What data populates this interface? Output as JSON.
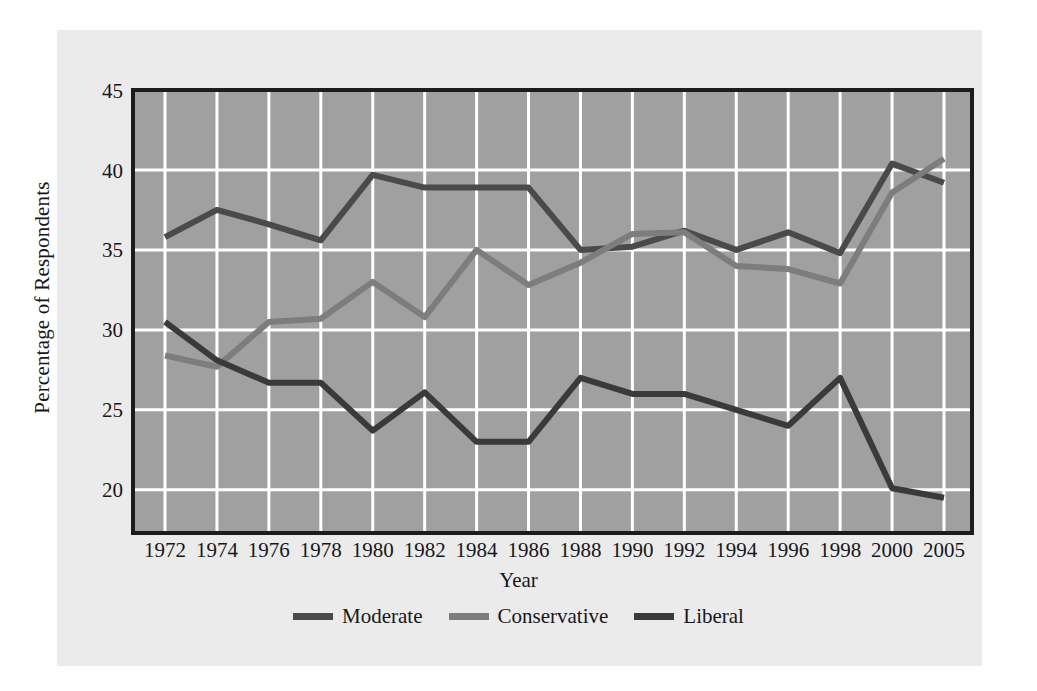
{
  "figure": {
    "background_color": "#ebebeb",
    "plot_background_color": "#a0a0a0",
    "gridline_color": "#ffffff",
    "axis_frame_color": "#1c1c1c"
  },
  "axes": {
    "y_label": "Percentage of Respondents",
    "x_label": "Year",
    "y_ticks": [
      "20",
      "25",
      "30",
      "35",
      "40",
      "45"
    ],
    "x_ticks": [
      "1972",
      "1974",
      "1976",
      "1978",
      "1980",
      "1982",
      "1984",
      "1986",
      "1988",
      "1990",
      "1992",
      "1994",
      "1996",
      "1998",
      "2000",
      "2005"
    ]
  },
  "legend": {
    "items": [
      {
        "label": "Moderate",
        "color": "#4a4a4a"
      },
      {
        "label": "Conservative",
        "color": "#7d7d7d"
      },
      {
        "label": "Liberal",
        "color": "#3a3a3a"
      }
    ]
  },
  "chart_data": {
    "type": "line",
    "title": "",
    "xlabel": "Year",
    "ylabel": "Percentage of Respondents",
    "categories": [
      "1972",
      "1974",
      "1976",
      "1978",
      "1980",
      "1982",
      "1984",
      "1986",
      "1988",
      "1990",
      "1992",
      "1994",
      "1996",
      "1998",
      "2000",
      "2005"
    ],
    "ylim": [
      17.3,
      45
    ],
    "yticks": [
      20,
      25,
      30,
      35,
      40,
      45
    ],
    "grid": true,
    "legend_position": "bottom",
    "series": [
      {
        "name": "Moderate",
        "color": "#4a4a4a",
        "values": [
          35.8,
          37.5,
          36.6,
          35.6,
          39.7,
          38.9,
          38.9,
          38.9,
          35.0,
          35.2,
          36.2,
          35.0,
          36.1,
          34.8,
          40.4,
          39.2
        ]
      },
      {
        "name": "Conservative",
        "color": "#7d7d7d",
        "values": [
          28.4,
          27.7,
          30.5,
          30.7,
          33.0,
          30.8,
          35.0,
          32.8,
          34.2,
          36.0,
          36.1,
          34.0,
          33.8,
          32.9,
          38.6,
          40.7
        ]
      },
      {
        "name": "Liberal",
        "color": "#3a3a3a",
        "values": [
          30.5,
          28.1,
          26.7,
          26.7,
          23.7,
          26.1,
          23.0,
          23.0,
          27.0,
          26.0,
          26.0,
          25.0,
          24.0,
          27.0,
          20.1,
          19.5
        ]
      }
    ]
  }
}
